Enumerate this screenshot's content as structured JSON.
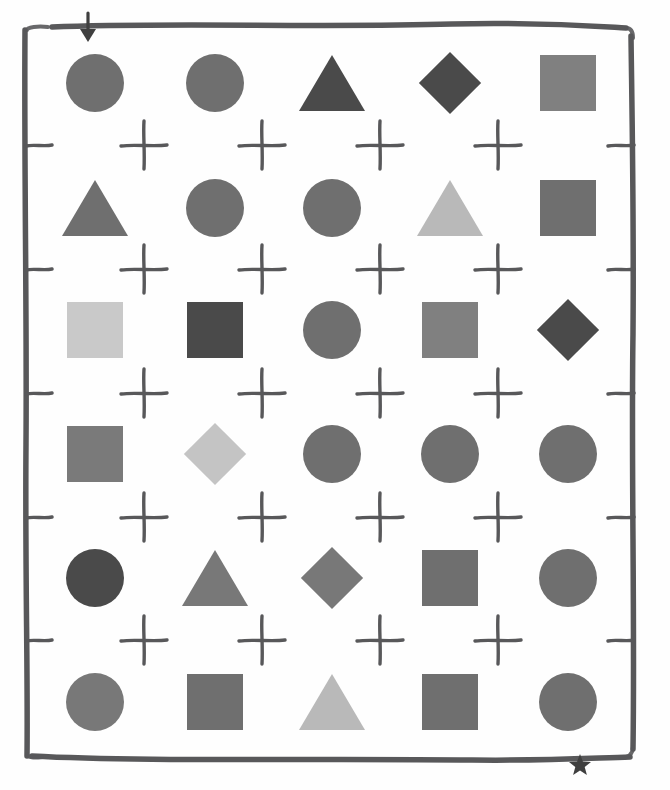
{
  "canvas": {
    "width": 670,
    "height": 790,
    "background": "#fefefe",
    "ink_color": "#58585a"
  },
  "markers": {
    "top_left": {
      "name": "down-arrow",
      "glyph": "↓",
      "x": 75,
      "y": 10,
      "color": "#3f3f3f"
    },
    "bottom_right": {
      "name": "star",
      "glyph": "★",
      "x": 568,
      "y": 753,
      "color": "#3f3f3f"
    }
  },
  "frame": {
    "label": "hand-drawn-rectangle-border",
    "x": 22,
    "y": 14,
    "width": 616,
    "height": 758,
    "stroke": "#58585a"
  },
  "grid": {
    "rows": 6,
    "columns": 5,
    "column_x": [
      52,
      172,
      289,
      407,
      525
    ],
    "row_y": [
      46,
      171,
      293,
      417,
      541,
      665
    ],
    "cross_columns_x": [
      117,
      235,
      353,
      471
    ],
    "cross_rows_y": [
      118,
      242,
      366,
      490,
      613
    ],
    "left_tick_x": 24,
    "right_tick_x": 606
  },
  "palette": {
    "very_light": "#c9c9c9",
    "light": "#b9b9b9",
    "medium": "#6f6f6f",
    "medium_dark": "#5f5f5f",
    "dark": "#4a4a4a"
  },
  "chart_data": {
    "type": "table",
    "xlabel": "",
    "ylabel": "",
    "legend": [],
    "categories": [
      "col-1",
      "col-2",
      "col-3",
      "col-4",
      "col-5"
    ],
    "rows": [
      {
        "row": 1,
        "cells": [
          {
            "shape": "circle",
            "color": "#6f6f6f",
            "tone": "medium"
          },
          {
            "shape": "circle",
            "color": "#6f6f6f",
            "tone": "medium"
          },
          {
            "shape": "triangle",
            "color": "#4a4a4a",
            "tone": "dark"
          },
          {
            "shape": "diamond",
            "color": "#4a4a4a",
            "tone": "dark"
          },
          {
            "shape": "square",
            "color": "#808080",
            "tone": "medium"
          }
        ]
      },
      {
        "row": 2,
        "cells": [
          {
            "shape": "triangle",
            "color": "#6f6f6f",
            "tone": "medium"
          },
          {
            "shape": "circle",
            "color": "#6f6f6f",
            "tone": "medium"
          },
          {
            "shape": "circle",
            "color": "#6f6f6f",
            "tone": "medium"
          },
          {
            "shape": "triangle",
            "color": "#b9b9b9",
            "tone": "light"
          },
          {
            "shape": "square",
            "color": "#6f6f6f",
            "tone": "medium"
          }
        ]
      },
      {
        "row": 3,
        "cells": [
          {
            "shape": "square",
            "color": "#c9c9c9",
            "tone": "very_light"
          },
          {
            "shape": "square",
            "color": "#4a4a4a",
            "tone": "dark"
          },
          {
            "shape": "circle",
            "color": "#6f6f6f",
            "tone": "medium"
          },
          {
            "shape": "square",
            "color": "#808080",
            "tone": "medium"
          },
          {
            "shape": "diamond",
            "color": "#4a4a4a",
            "tone": "dark"
          }
        ]
      },
      {
        "row": 4,
        "cells": [
          {
            "shape": "square",
            "color": "#7a7a7a",
            "tone": "medium"
          },
          {
            "shape": "diamond",
            "color": "#c4c4c4",
            "tone": "very_light"
          },
          {
            "shape": "circle",
            "color": "#6f6f6f",
            "tone": "medium"
          },
          {
            "shape": "circle",
            "color": "#6f6f6f",
            "tone": "medium"
          },
          {
            "shape": "circle",
            "color": "#6f6f6f",
            "tone": "medium"
          }
        ]
      },
      {
        "row": 5,
        "cells": [
          {
            "shape": "circle",
            "color": "#4a4a4a",
            "tone": "dark"
          },
          {
            "shape": "triangle",
            "color": "#787878",
            "tone": "medium"
          },
          {
            "shape": "diamond",
            "color": "#787878",
            "tone": "medium"
          },
          {
            "shape": "square",
            "color": "#6f6f6f",
            "tone": "medium"
          },
          {
            "shape": "circle",
            "color": "#6f6f6f",
            "tone": "medium"
          }
        ]
      },
      {
        "row": 6,
        "cells": [
          {
            "shape": "circle",
            "color": "#787878",
            "tone": "medium"
          },
          {
            "shape": "square",
            "color": "#6f6f6f",
            "tone": "medium"
          },
          {
            "shape": "triangle",
            "color": "#b9b9b9",
            "tone": "light"
          },
          {
            "shape": "square",
            "color": "#6f6f6f",
            "tone": "medium"
          },
          {
            "shape": "circle",
            "color": "#6f6f6f",
            "tone": "medium"
          }
        ]
      }
    ]
  }
}
